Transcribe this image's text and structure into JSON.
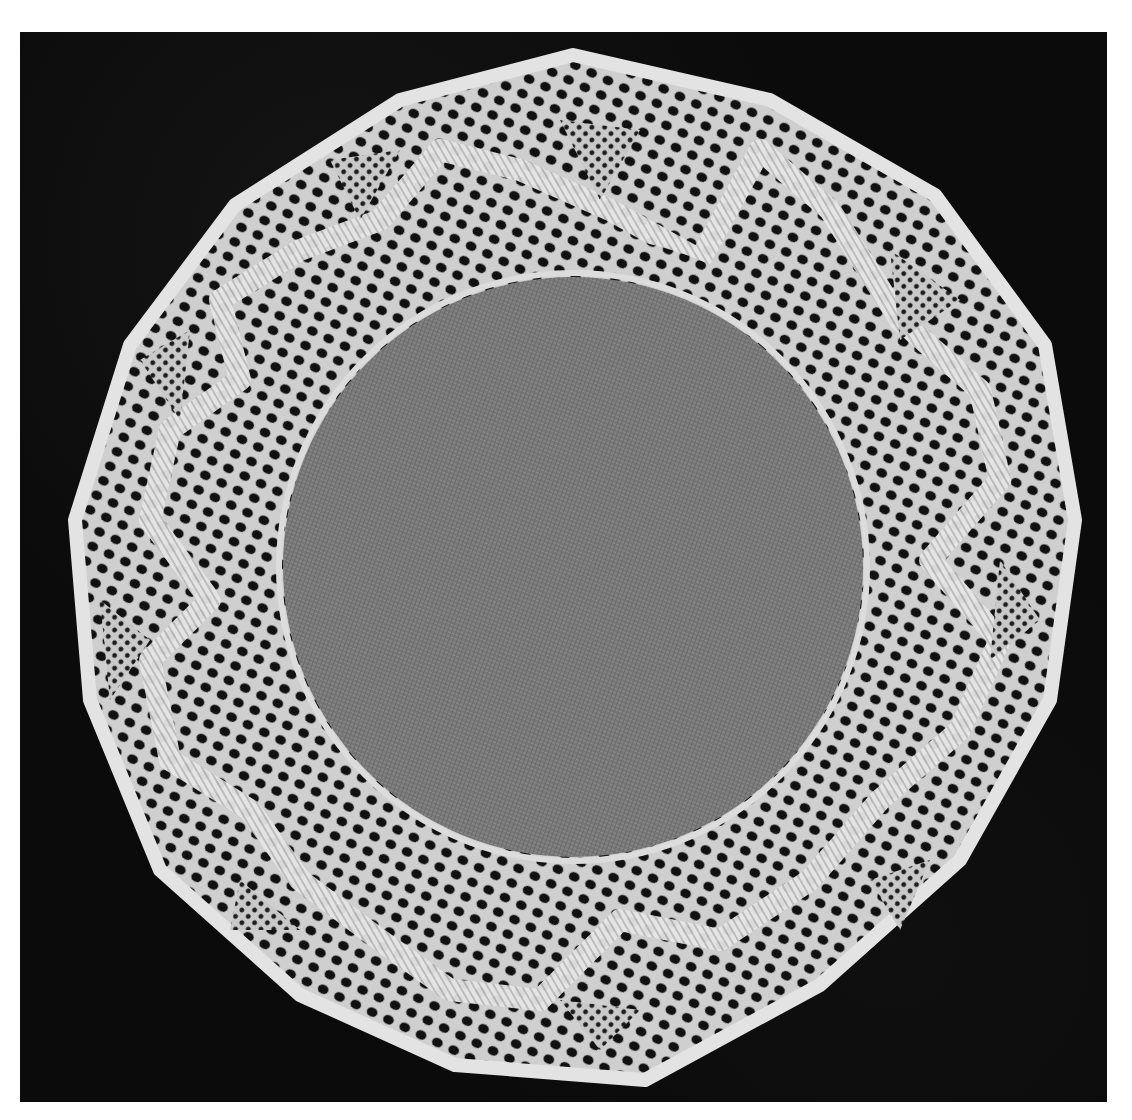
{
  "image": {
    "subject": "circular bobbin lace doily with linen center",
    "medium": "black-and-white photograph",
    "colors": {
      "background": "#0b0b0b",
      "page": "#ffffff",
      "lace": "#d8d8d8",
      "lace_bright": "#f0f0f0",
      "linen_center": "#7a7a7a"
    },
    "doily": {
      "scallop_points": 13,
      "center_x": 573,
      "center_y": 567,
      "linen_radius": 290,
      "outer_radius": 505
    }
  }
}
